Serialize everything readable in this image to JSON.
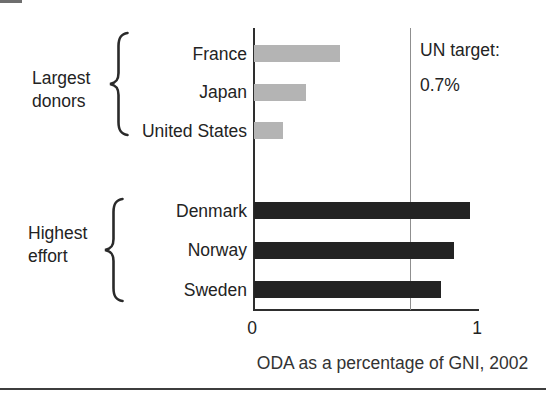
{
  "figure": {
    "bottom_rule_color": "#3d3d3d",
    "artifact_color": "#6e6e6e"
  },
  "chart_data": {
    "type": "bar",
    "orientation": "horizontal",
    "title": "",
    "xlabel": "ODA as a percentage of GNI, 2002",
    "ylabel": "",
    "xlim": [
      0,
      1
    ],
    "grid": false,
    "x_ticks": [
      {
        "label": "0",
        "value": 0
      },
      {
        "label": "1",
        "value": 1
      }
    ],
    "reference_line": {
      "value": 0.7,
      "text_lines": [
        "UN target:",
        "0.7%"
      ]
    },
    "groups": [
      {
        "label": "Largest donors",
        "label_lines": [
          "Largest",
          "donors"
        ],
        "bar_color": "#b4b4b4",
        "items": [
          {
            "category": "France",
            "value": 0.38
          },
          {
            "category": "Japan",
            "value": 0.23
          },
          {
            "category": "United States",
            "value": 0.13
          }
        ]
      },
      {
        "label": "Highest effort",
        "label_lines": [
          "Highest",
          "effort"
        ],
        "bar_color": "#232323",
        "items": [
          {
            "category": "Denmark",
            "value": 0.96
          },
          {
            "category": "Norway",
            "value": 0.89
          },
          {
            "category": "Sweden",
            "value": 0.83
          }
        ]
      }
    ],
    "colors": {
      "axis": "#2e2e2e",
      "target_line": "#8f8f8f",
      "light_bar": "#b4b4b4",
      "dark_bar": "#232323",
      "text": "#232323"
    }
  }
}
